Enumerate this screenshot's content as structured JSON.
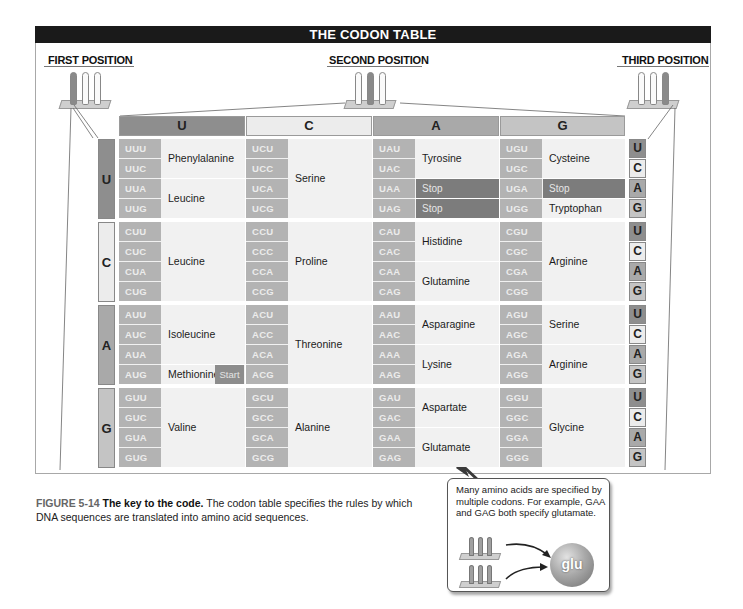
{
  "title": "THE CODON TABLE",
  "position_labels": {
    "first": "FIRST POSITION",
    "second": "SECOND POSITION",
    "third": "THIRD POSITION"
  },
  "second_position_headers": [
    "U",
    "C",
    "A",
    "G"
  ],
  "first_position_rows": [
    "U",
    "C",
    "A",
    "G"
  ],
  "third_position_letters": [
    "U",
    "C",
    "A",
    "G"
  ],
  "colors": {
    "title_bg": "#1a1a1a",
    "U": "#8e8e8e",
    "C": "#ececec",
    "A": "#a9a9a9",
    "G": "#c4c4c4",
    "codon_box": "#b3b3b3",
    "stop_bg": "#7c7c7c",
    "start_bg": "#8d8d8d"
  },
  "codon_table": {
    "U": {
      "U": {
        "codons": [
          "UUU",
          "UUC",
          "UUA",
          "UUG"
        ],
        "groups": [
          {
            "name": "Phenylalanine",
            "span": [
              0,
              1
            ]
          },
          {
            "name": "Leucine",
            "span": [
              2,
              3
            ]
          }
        ]
      },
      "C": {
        "codons": [
          "UCU",
          "UCC",
          "UCA",
          "UCG"
        ],
        "groups": [
          {
            "name": "Serine",
            "span": [
              0,
              3
            ]
          }
        ]
      },
      "A": {
        "codons": [
          "UAU",
          "UAC",
          "UAA",
          "UAG"
        ],
        "groups": [
          {
            "name": "Tyrosine",
            "span": [
              0,
              1
            ]
          },
          {
            "name": "Stop",
            "span": [
              2,
              2
            ],
            "stop": true
          },
          {
            "name": "Stop",
            "span": [
              3,
              3
            ],
            "stop": true
          }
        ]
      },
      "G": {
        "codons": [
          "UGU",
          "UGC",
          "UGA",
          "UGG"
        ],
        "groups": [
          {
            "name": "Cysteine",
            "span": [
              0,
              1
            ]
          },
          {
            "name": "Stop",
            "span": [
              2,
              2
            ],
            "stop": true
          },
          {
            "name": "Tryptophan",
            "span": [
              3,
              3
            ]
          }
        ]
      }
    },
    "C": {
      "U": {
        "codons": [
          "CUU",
          "CUC",
          "CUA",
          "CUG"
        ],
        "groups": [
          {
            "name": "Leucine",
            "span": [
              0,
              3
            ]
          }
        ]
      },
      "C": {
        "codons": [
          "CCU",
          "CCC",
          "CCA",
          "CCG"
        ],
        "groups": [
          {
            "name": "Proline",
            "span": [
              0,
              3
            ]
          }
        ]
      },
      "A": {
        "codons": [
          "CAU",
          "CAC",
          "CAA",
          "CAG"
        ],
        "groups": [
          {
            "name": "Histidine",
            "span": [
              0,
              1
            ]
          },
          {
            "name": "Glutamine",
            "span": [
              2,
              3
            ]
          }
        ]
      },
      "G": {
        "codons": [
          "CGU",
          "CGC",
          "CGA",
          "CGG"
        ],
        "groups": [
          {
            "name": "Arginine",
            "span": [
              0,
              3
            ]
          }
        ]
      }
    },
    "A": {
      "U": {
        "codons": [
          "AUU",
          "AUC",
          "AUA",
          "AUG"
        ],
        "groups": [
          {
            "name": "Isoleucine",
            "span": [
              0,
              2
            ]
          },
          {
            "name": "Methionine",
            "span": [
              3,
              3
            ],
            "badge": "Start"
          }
        ]
      },
      "C": {
        "codons": [
          "ACU",
          "ACC",
          "ACA",
          "ACG"
        ],
        "groups": [
          {
            "name": "Threonine",
            "span": [
              0,
              3
            ]
          }
        ]
      },
      "A": {
        "codons": [
          "AAU",
          "AAC",
          "AAA",
          "AAG"
        ],
        "groups": [
          {
            "name": "Asparagine",
            "span": [
              0,
              1
            ]
          },
          {
            "name": "Lysine",
            "span": [
              2,
              3
            ]
          }
        ]
      },
      "G": {
        "codons": [
          "AGU",
          "AGC",
          "AGA",
          "AGG"
        ],
        "groups": [
          {
            "name": "Serine",
            "span": [
              0,
              1
            ]
          },
          {
            "name": "Arginine",
            "span": [
              2,
              3
            ]
          }
        ]
      }
    },
    "G": {
      "U": {
        "codons": [
          "GUU",
          "GUC",
          "GUA",
          "GUG"
        ],
        "groups": [
          {
            "name": "Valine",
            "span": [
              0,
              3
            ]
          }
        ]
      },
      "C": {
        "codons": [
          "GCU",
          "GCC",
          "GCA",
          "GCG"
        ],
        "groups": [
          {
            "name": "Alanine",
            "span": [
              0,
              3
            ]
          }
        ]
      },
      "A": {
        "codons": [
          "GAU",
          "GAC",
          "GAA",
          "GAG"
        ],
        "groups": [
          {
            "name": "Aspartate",
            "span": [
              0,
              1
            ]
          },
          {
            "name": "Glutamate",
            "span": [
              2,
              3
            ]
          }
        ]
      },
      "G": {
        "codons": [
          "GGU",
          "GGC",
          "GGA",
          "GGG"
        ],
        "groups": [
          {
            "name": "Glycine",
            "span": [
              0,
              3
            ]
          }
        ]
      }
    }
  },
  "caption": {
    "figure_number": "FIGURE 5-14",
    "figure_title": "The key to the code.",
    "text": "The codon table specifies the rules by which DNA sequences are translated into amino acid sequences."
  },
  "callout": {
    "text": "Many amino acids are specified by multiple codons. For example, GAA and GAG both specify glutamate.",
    "amino_acid_label": "glu"
  }
}
